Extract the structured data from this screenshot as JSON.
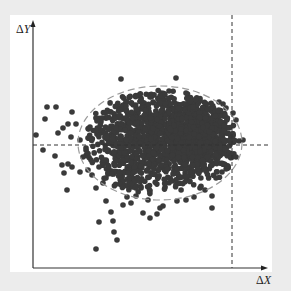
{
  "chart_data": {
    "type": "scatter",
    "title": "",
    "xlabel": "ΔX",
    "ylabel": "ΔY",
    "grid": false,
    "legend": null,
    "axes": {
      "x_ticks": [],
      "y_ticks": [],
      "arrows": true
    },
    "reference_lines": [
      {
        "orientation": "horizontal",
        "style": "dashed",
        "color": "#333333",
        "y_px": 145
      },
      {
        "orientation": "vertical",
        "style": "dashed",
        "color": "#333333",
        "x_px": 232
      }
    ],
    "confidence_ellipse": {
      "style": "dashed",
      "color": "#9a9a9a",
      "cx_px": 160,
      "cy_px": 143,
      "rx_px": 82,
      "ry_px": 57
    },
    "point_style": {
      "color": "#3a3a3a",
      "radius_px": 2.8
    },
    "clusters": [
      {
        "name": "dense-right",
        "cx_px": 195,
        "cy_px": 135,
        "sx": 22,
        "sy": 22,
        "n": 900
      },
      {
        "name": "dense-left",
        "cx_px": 135,
        "cy_px": 140,
        "sx": 26,
        "sy": 30,
        "n": 650
      }
    ],
    "outliers_px": [
      [
        121,
        79
      ],
      [
        176,
        78
      ],
      [
        47,
        107
      ],
      [
        56,
        107
      ],
      [
        45,
        119
      ],
      [
        72,
        112
      ],
      [
        68,
        124
      ],
      [
        63,
        128
      ],
      [
        76,
        124
      ],
      [
        36,
        135
      ],
      [
        58,
        133
      ],
      [
        71,
        137
      ],
      [
        80,
        140
      ],
      [
        88,
        138
      ],
      [
        43,
        150
      ],
      [
        55,
        156
      ],
      [
        62,
        165
      ],
      [
        68,
        164
      ],
      [
        72,
        167
      ],
      [
        64,
        173
      ],
      [
        80,
        172
      ],
      [
        67,
        190
      ],
      [
        96,
        188
      ],
      [
        103,
        183
      ],
      [
        106,
        178
      ],
      [
        112,
        174
      ],
      [
        106,
        201
      ],
      [
        111,
        212
      ],
      [
        113,
        221
      ],
      [
        99,
        222
      ],
      [
        114,
        232
      ],
      [
        117,
        240
      ],
      [
        96,
        249
      ],
      [
        143,
        213
      ],
      [
        150,
        218
      ],
      [
        157,
        214
      ],
      [
        160,
        208
      ],
      [
        163,
        206
      ],
      [
        212,
        196
      ],
      [
        212,
        208
      ],
      [
        216,
        178
      ],
      [
        222,
        172
      ],
      [
        227,
        166
      ],
      [
        236,
        157
      ],
      [
        239,
        141
      ],
      [
        243,
        140
      ],
      [
        236,
        120
      ],
      [
        233,
        113
      ],
      [
        226,
        108
      ],
      [
        223,
        104
      ],
      [
        219,
        102
      ],
      [
        186,
        93
      ],
      [
        169,
        91
      ],
      [
        160,
        96
      ],
      [
        150,
        97
      ],
      [
        141,
        100
      ],
      [
        131,
        103
      ],
      [
        126,
        106
      ],
      [
        120,
        110
      ],
      [
        111,
        112
      ],
      [
        102,
        118
      ],
      [
        97,
        121
      ],
      [
        90,
        127
      ],
      [
        86,
        148
      ],
      [
        83,
        157
      ],
      [
        91,
        160
      ],
      [
        88,
        170
      ],
      [
        92,
        175
      ],
      [
        99,
        167
      ],
      [
        104,
        160
      ],
      [
        127,
        197
      ],
      [
        136,
        196
      ],
      [
        123,
        205
      ],
      [
        131,
        203
      ],
      [
        186,
        200
      ],
      [
        177,
        201
      ],
      [
        194,
        197
      ],
      [
        200,
        188
      ],
      [
        205,
        190
      ],
      [
        148,
        200
      ]
    ],
    "xlim_px": [
      33,
      268
    ],
    "ylim_px": [
      20,
      268
    ]
  },
  "labels": {
    "y_delta": "Δ",
    "y_var": "Y",
    "x_delta": "Δ",
    "x_var": "X"
  }
}
